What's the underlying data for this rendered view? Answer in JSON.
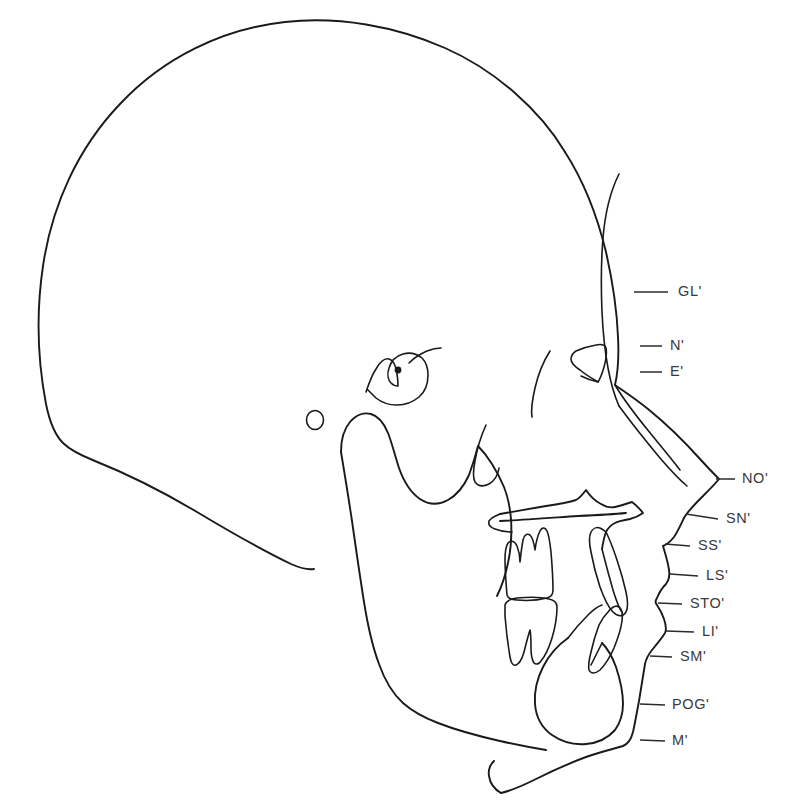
{
  "figure": {
    "name": "lateral-cephalometric-tracing",
    "background_color": "#ffffff",
    "line_color": "#1a1a1a",
    "label_color": "#3a3a3a",
    "width": 786,
    "height": 803
  },
  "landmarks": [
    {
      "id": "gl",
      "label": "GL'",
      "full_name": "soft-tissue-glabella",
      "label_x": 678,
      "label_y": 292,
      "leader_x1": 634,
      "leader_y1": 292,
      "leader_x2": 668,
      "leader_y2": 292
    },
    {
      "id": "n",
      "label": "N'",
      "full_name": "soft-tissue-nasion",
      "label_x": 670,
      "label_y": 346,
      "leader_x1": 640,
      "leader_y1": 346,
      "leader_x2": 662,
      "leader_y2": 346
    },
    {
      "id": "e",
      "label": "E'",
      "full_name": "soft-tissue-endocanthion",
      "label_x": 670,
      "label_y": 372,
      "leader_x1": 640,
      "leader_y1": 372,
      "leader_x2": 662,
      "leader_y2": 372
    },
    {
      "id": "no",
      "label": "NO'",
      "full_name": "soft-tissue-pronasale-nose-tip",
      "label_x": 742,
      "label_y": 479,
      "leader_x1": 716,
      "leader_y1": 479,
      "leader_x2": 735,
      "leader_y2": 479
    },
    {
      "id": "sn",
      "label": "SN'",
      "full_name": "soft-tissue-subnasale",
      "label_x": 726,
      "label_y": 519,
      "leader_x1": 686,
      "leader_y1": 515,
      "leader_x2": 718,
      "leader_y2": 519
    },
    {
      "id": "ss",
      "label": "SS'",
      "full_name": "soft-tissue-subspinale",
      "label_x": 698,
      "label_y": 546,
      "leader_x1": 665,
      "leader_y1": 544,
      "leader_x2": 690,
      "leader_y2": 546
    },
    {
      "id": "ls",
      "label": "LS'",
      "full_name": "labrale-superius",
      "label_x": 706,
      "label_y": 576,
      "leader_x1": 670,
      "leader_y1": 574,
      "leader_x2": 698,
      "leader_y2": 576
    },
    {
      "id": "sto",
      "label": "STO'",
      "full_name": "stomion",
      "label_x": 690,
      "label_y": 604,
      "leader_x1": 658,
      "leader_y1": 603,
      "leader_x2": 682,
      "leader_y2": 604
    },
    {
      "id": "li",
      "label": "LI'",
      "full_name": "labrale-inferius",
      "label_x": 702,
      "label_y": 632,
      "leader_x1": 666,
      "leader_y1": 631,
      "leader_x2": 694,
      "leader_y2": 632
    },
    {
      "id": "sm",
      "label": "SM'",
      "full_name": "soft-tissue-supramentale",
      "label_x": 680,
      "label_y": 657,
      "leader_x1": 650,
      "leader_y1": 656,
      "leader_x2": 672,
      "leader_y2": 657
    },
    {
      "id": "pog",
      "label": "POG'",
      "full_name": "soft-tissue-pogonion",
      "label_x": 672,
      "label_y": 705,
      "leader_x1": 640,
      "leader_y1": 703,
      "leader_x2": 665,
      "leader_y2": 705
    },
    {
      "id": "m",
      "label": "M'",
      "full_name": "soft-tissue-menton",
      "label_x": 672,
      "label_y": 741,
      "leader_x1": 640,
      "leader_y1": 739,
      "leader_x2": 665,
      "leader_y2": 741
    }
  ],
  "anatomy": [
    {
      "id": "cranial-vault",
      "name": "cranial-vault-outline"
    },
    {
      "id": "soft-tissue-profile",
      "name": "soft-tissue-facial-profile"
    },
    {
      "id": "frontal-bone",
      "name": "frontal-bone-inner-table"
    },
    {
      "id": "nasal-bone",
      "name": "nasal-bone"
    },
    {
      "id": "sella-turcica",
      "name": "sella-turcica"
    },
    {
      "id": "sella-point",
      "name": "sella-point-dot"
    },
    {
      "id": "porion",
      "name": "porion-circle"
    },
    {
      "id": "orbital-rim",
      "name": "orbital-rim"
    },
    {
      "id": "eye",
      "name": "eye-triangle"
    },
    {
      "id": "maxilla",
      "name": "maxilla-and-palate"
    },
    {
      "id": "ans",
      "name": "anterior-nasal-spine"
    },
    {
      "id": "pterygoid",
      "name": "pterygomaxillary-fissure"
    },
    {
      "id": "mandible",
      "name": "mandible-ramus-and-body"
    },
    {
      "id": "condyle",
      "name": "mandibular-condyle"
    },
    {
      "id": "coronoid",
      "name": "coronoid-process"
    },
    {
      "id": "symphysis",
      "name": "mandibular-symphysis"
    },
    {
      "id": "upper-molar",
      "name": "upper-molar-tooth"
    },
    {
      "id": "lower-molar",
      "name": "lower-molar-tooth"
    },
    {
      "id": "upper-incisor",
      "name": "upper-incisor-tooth"
    },
    {
      "id": "lower-incisor",
      "name": "lower-incisor-tooth"
    },
    {
      "id": "neck",
      "name": "submental-neck-line"
    }
  ]
}
